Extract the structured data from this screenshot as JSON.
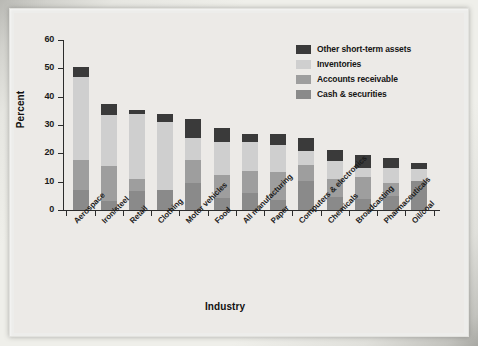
{
  "chart_data": {
    "type": "bar",
    "subtype": "stacked-bar",
    "title": "",
    "xlabel": "Industry",
    "ylabel": "Percent",
    "ylim": [
      0,
      60
    ],
    "yticks": [
      0,
      10,
      20,
      30,
      40,
      50,
      60
    ],
    "grid": false,
    "legend_position": "top-right",
    "categories": [
      "Aerospace",
      "Iron/steel",
      "Retail",
      "Clothing",
      "Motor vehicles",
      "Food",
      "All manufacturing",
      "Paper",
      "Computers & electronics",
      "Chemicals",
      "Broadcasting",
      "Pharmaceuticals",
      "Oil/coal"
    ],
    "series": [
      {
        "name": "Cash & securities",
        "color": "#8a8a8a",
        "values": [
          7.2,
          3.2,
          6.6,
          7.0,
          9.5,
          4.1,
          6.1,
          3.6,
          10.3,
          4.6,
          4.0,
          5.1,
          10.1
        ]
      },
      {
        "name": "Accounts receivable",
        "color": "#9e9e9e",
        "values": [
          10.4,
          12.2,
          4.5,
          0.0,
          8.0,
          8.4,
          7.6,
          9.9,
          5.7,
          6.5,
          7.5,
          4.3,
          0.0
        ]
      },
      {
        "name": "Inventories",
        "color": "#cfcfcf",
        "values": [
          29.4,
          18.1,
          22.9,
          24.0,
          8.0,
          11.4,
          10.2,
          9.6,
          5.0,
          6.3,
          3.5,
          5.5,
          4.5
        ]
      },
      {
        "name": "Other short-term assets",
        "color": "#3a3a3a",
        "values": [
          3.5,
          3.8,
          1.3,
          2.8,
          6.6,
          5.1,
          3.1,
          3.9,
          4.5,
          3.9,
          4.4,
          3.3,
          2.1
        ]
      }
    ],
    "totals": [
      50.5,
      37.3,
      35.3,
      33.8,
      32.1,
      29.0,
      27.0,
      27.0,
      25.5,
      21.3,
      19.4,
      18.2,
      16.7
    ]
  },
  "legend": {
    "items": [
      {
        "label": "Other short-term assets",
        "color": "#3a3a3a"
      },
      {
        "label": "Inventories",
        "color": "#cfcfcf"
      },
      {
        "label": "Accounts receivable",
        "color": "#9e9e9e"
      },
      {
        "label": "Cash & securities",
        "color": "#8a8a8a"
      }
    ]
  },
  "axes": {
    "y_title": "Percent",
    "x_title": "Industry",
    "y_tick_labels": [
      "0",
      "10",
      "20",
      "30",
      "40",
      "50",
      "60"
    ]
  },
  "colors": {
    "page_background": "#ededeb",
    "plot_background": "#eceae7",
    "axis": "#2c2c2c",
    "text": "#1a1a1a"
  }
}
